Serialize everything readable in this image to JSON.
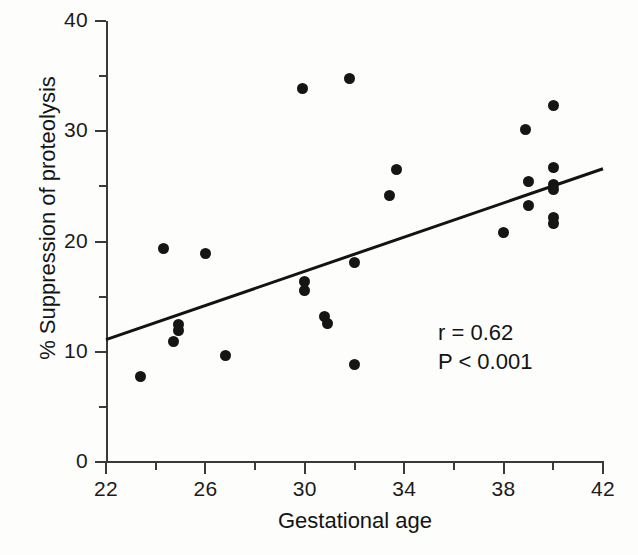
{
  "chart_data": {
    "type": "scatter",
    "title": "",
    "xlabel": "Gestational age",
    "ylabel": "% Suppression of proteolysis",
    "xlim": [
      22,
      42
    ],
    "ylim": [
      0,
      40
    ],
    "grid": false,
    "legend": null,
    "x_ticks_major": [
      22,
      26,
      30,
      34,
      38,
      42
    ],
    "x_ticks_minor": [
      24,
      28,
      32,
      36,
      40
    ],
    "x_tick_labels": [
      "22",
      "26",
      "30",
      "34",
      "38",
      "42"
    ],
    "y_ticks_major": [
      0,
      10,
      20,
      30,
      40
    ],
    "y_ticks_minor": [
      5,
      15,
      25,
      35
    ],
    "y_tick_labels": [
      "0",
      "10",
      "20",
      "30",
      "40"
    ],
    "marker": "filled-circle",
    "marker_color": "#151515",
    "points": [
      {
        "x": 23.4,
        "y": 7.8
      },
      {
        "x": 24.3,
        "y": 19.4
      },
      {
        "x": 24.7,
        "y": 10.9
      },
      {
        "x": 24.9,
        "y": 12.5
      },
      {
        "x": 24.9,
        "y": 11.9
      },
      {
        "x": 26.0,
        "y": 18.9
      },
      {
        "x": 26.8,
        "y": 9.7
      },
      {
        "x": 29.9,
        "y": 33.9
      },
      {
        "x": 30.0,
        "y": 16.4
      },
      {
        "x": 30.0,
        "y": 15.6
      },
      {
        "x": 30.8,
        "y": 13.2
      },
      {
        "x": 30.9,
        "y": 12.6
      },
      {
        "x": 31.8,
        "y": 34.8
      },
      {
        "x": 32.0,
        "y": 18.1
      },
      {
        "x": 32.0,
        "y": 8.8
      },
      {
        "x": 33.4,
        "y": 24.2
      },
      {
        "x": 33.7,
        "y": 26.5
      },
      {
        "x": 38.0,
        "y": 20.8
      },
      {
        "x": 38.9,
        "y": 30.2
      },
      {
        "x": 39.0,
        "y": 25.4
      },
      {
        "x": 39.0,
        "y": 23.3
      },
      {
        "x": 40.0,
        "y": 32.3
      },
      {
        "x": 40.0,
        "y": 26.7
      },
      {
        "x": 40.0,
        "y": 25.2
      },
      {
        "x": 40.0,
        "y": 24.7
      },
      {
        "x": 40.0,
        "y": 22.2
      },
      {
        "x": 40.0,
        "y": 21.6
      }
    ],
    "fit_line": {
      "x_start": 22,
      "y_start": 11.1,
      "x_end": 42,
      "y_end": 26.6,
      "color": "#131313",
      "width": 3
    },
    "annotations": {
      "correlation": "r = 0.62",
      "pvalue": "P < 0.001"
    }
  }
}
